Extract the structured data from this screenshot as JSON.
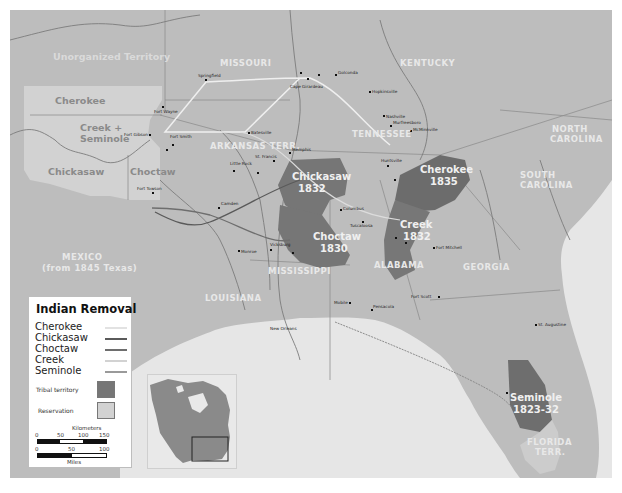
{
  "map": {
    "title": "Indian Removal",
    "colors": {
      "land": "#bdbdbd",
      "reservation": "#d0d0d0",
      "tribal_territory": "#767676",
      "water": "#e6e6e6",
      "route_cherokee": "#efefef",
      "route_chickasaw": "#5a5a5a",
      "route_choctaw": "#6e6e6e",
      "route_creek": "#dcdcdc",
      "route_seminole": "#8c8c8c"
    },
    "territories": {
      "unorganized": "Unorganized Territory",
      "cherokee_res": "Cherokee",
      "creek_seminole_line1": "Creek +",
      "creek_seminole_line2": "Seminole",
      "chickasaw_res": "Chickasaw",
      "choctaw_res": "Choctaw",
      "mexico_line1": "MEXICO",
      "mexico_line2": "(from 1845 Texas)"
    },
    "states": {
      "missouri": "MISSOURI",
      "kentucky": "KENTUCKY",
      "tennessee": "TENNESSEE",
      "arkansas": "ARKANSAS TERR.",
      "north_carolina_1": "NORTH",
      "north_carolina_2": "CAROLINA",
      "south_carolina_1": "SOUTH",
      "south_carolina_2": "CAROLINA",
      "georgia": "GEORGIA",
      "alabama": "ALABAMA",
      "mississippi": "MISSISSIPPI",
      "louisiana": "LOUISIANA",
      "florida_1": "FLORIDA",
      "florida_2": "TERR."
    },
    "tribal_lands": {
      "chickasaw": {
        "name": "Chickasaw",
        "year": "1832"
      },
      "choctaw": {
        "name": "Choctaw",
        "year": "1830"
      },
      "cherokee": {
        "name": "Cherokee",
        "year": "1835"
      },
      "creek": {
        "name": "Creek",
        "year": "1832"
      },
      "seminole": {
        "name": "Seminole",
        "year": "1823-32"
      }
    },
    "cities": [
      "Springfield",
      "Dalsvirun",
      "Cape Girardeau",
      "Jonesboro",
      "Golconda",
      "Hopkinsville",
      "Nashville",
      "Murfreesboro",
      "McMinnville",
      "Fort Wayne",
      "Fort Gibson",
      "Fort Smith",
      "Fort Jackson",
      "Batesville",
      "Little Rock",
      "St. Francis",
      "Rockroe",
      "Memphis",
      "Tuscumbia",
      "Huntsville",
      "Gunter's Landing",
      "Fort Towson",
      "Camden",
      "Monroe",
      "Vicksburg",
      "Jackson",
      "Columbus",
      "Tuscaloosa",
      "Montevallo",
      "Wetumpka",
      "Tallassee",
      "Fort Mitchell",
      "Mobile",
      "Pensacola",
      "Fort Scott",
      "Fowltown",
      "St. Augustine",
      "Fort King",
      "New Orleans",
      "Fort Jupiter",
      "Ross's Landing",
      "Fort Mims",
      "Burnt Corn Creek",
      "Apalachicola River",
      "Clinch's Battle",
      "Dade Battle"
    ],
    "events": {
      "ceremony_mound": "Ceremony Mound 1817",
      "talladega": "Talladega 11/9/1813",
      "tallushatchee": "Tallushatchee 11/3/1813",
      "horseshoe_bend": "Horseshoe Bend 3/27/1814",
      "autossee": "Autossee 11/29/1813",
      "burnt_corn": "Burnt Corn Creek 7/27/1813",
      "fort_mims": "Fort Mims 8/30/1813",
      "fowltown": "Fowltown 11/21/1817",
      "apalachicola": "Apalachicola River 7/27/1816",
      "fort_king": "Fort King 1827",
      "dade": "Dade Battle 1835",
      "clinch": "Clinch's Battle 1835",
      "okeechobee": "Okeechobee 12/25/1837",
      "jupiter": "Fort Jupiter 1/24/1838",
      "lake_okeechobee_battle": "Lake Okeechobee 12/25/1837",
      "kickapoo": "Kickapoo 10/8/1838"
    }
  },
  "legend": {
    "title": "Indian Removal",
    "routes": [
      {
        "label": "Cherokee"
      },
      {
        "label": "Chickasaw"
      },
      {
        "label": "Choctaw"
      },
      {
        "label": "Creek"
      },
      {
        "label": "Seminole"
      }
    ],
    "swatches": [
      {
        "label": "Tribal territory"
      },
      {
        "label": "Reservation"
      }
    ],
    "scale": {
      "km_label": "Kilometers",
      "km_ticks": [
        "0",
        "50",
        "100",
        "150"
      ],
      "mi_ticks": [
        "0",
        "50",
        "100"
      ],
      "mi_label": "Miles"
    }
  },
  "inset": {
    "label": "North America locator"
  }
}
